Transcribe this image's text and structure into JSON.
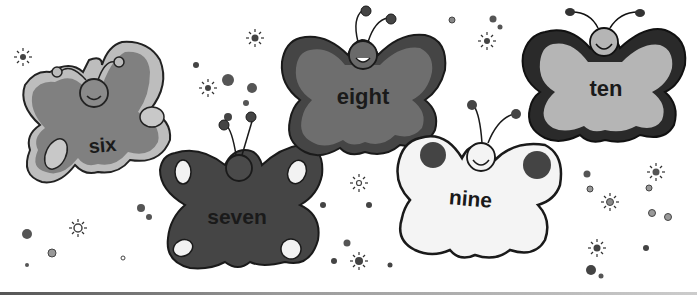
{
  "illustration": {
    "theme": "counting butterflies",
    "butterflies": [
      {
        "label": "six",
        "body_color": "#8a8a8a",
        "wing_color": "#808080",
        "edge_color": "#bdbdbd",
        "spot_color": "#c8c8c8"
      },
      {
        "label": "seven",
        "body_color": "#4a4a4a",
        "wing_color": "#454545",
        "edge_color": "#3a3a3a",
        "spot_color": "#f2f2f2"
      },
      {
        "label": "eight",
        "body_color": "#6a6a6a",
        "wing_color": "#6e6e6e",
        "edge_color": "#454545",
        "spot_color": "#6e6e6e"
      },
      {
        "label": "nine",
        "body_color": "#f4f4f4",
        "wing_color": "#f4f4f4",
        "edge_color": "#3a3a3a",
        "spot_color": "#444444"
      },
      {
        "label": "ten",
        "body_color": "#b5b5b5",
        "wing_color": "#b5b5b5",
        "edge_color": "#2a2a2a",
        "spot_color": "#b5b5b5"
      }
    ],
    "decorations": "sparkles-and-dots"
  }
}
